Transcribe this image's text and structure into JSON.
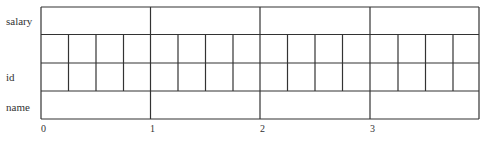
{
  "diagram": {
    "row_labels": [
      "salary",
      "id",
      "name"
    ],
    "tick_labels": [
      "0",
      "1",
      "2",
      "3"
    ],
    "major_sections": 4,
    "sub_cells_per_section": 4,
    "rows": [
      {
        "name": "salary",
        "subdivided": false
      },
      {
        "name": "id-upper",
        "subdivided": true
      },
      {
        "name": "id-lower",
        "subdivided": true
      },
      {
        "name": "name",
        "subdivided": false
      }
    ],
    "line_color": "#333333"
  }
}
